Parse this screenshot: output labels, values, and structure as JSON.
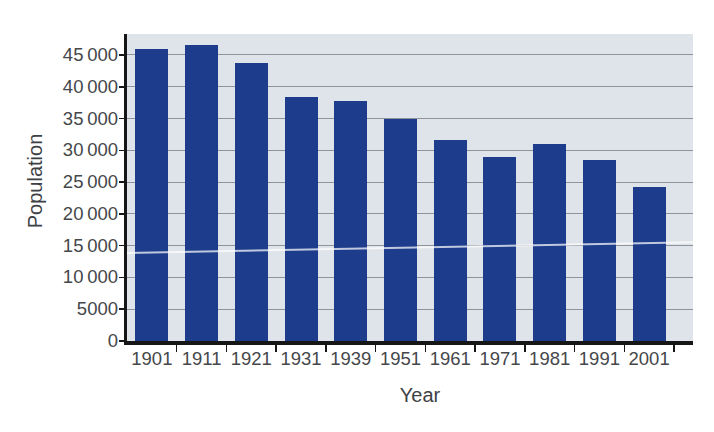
{
  "chart_data": {
    "type": "bar",
    "title": "",
    "xlabel": "Year",
    "ylabel": "Population",
    "categories": [
      "1901",
      "1911",
      "1921",
      "1931",
      "1939",
      "1951",
      "1961",
      "1971",
      "1981",
      "1991",
      "2001"
    ],
    "values": [
      46000,
      46600,
      43800,
      38400,
      37800,
      35000,
      31600,
      29000,
      31000,
      28400,
      24200
    ],
    "ytick_step": 5000,
    "ytick_labels": [
      "0",
      "5000",
      "10 000",
      "15 000",
      "20 000",
      "25 000",
      "30 000",
      "35 000",
      "40 000",
      "45 000"
    ],
    "ylim": [
      0,
      48300
    ],
    "grid": "horizontal",
    "legend": "none",
    "colors": {
      "bar": "#1d3c8c",
      "plot_background": "#dfe3ea",
      "gridline": "#8f949c",
      "axis": "#161616",
      "tick_text": "#45474a",
      "axis_title_text": "#3e4144",
      "page_background": "#ffffff"
    }
  }
}
